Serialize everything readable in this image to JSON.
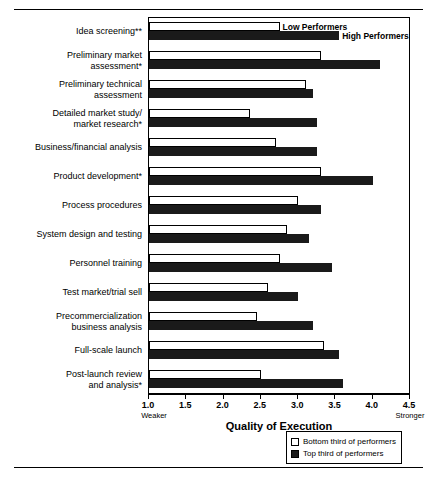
{
  "chart_data": {
    "type": "bar",
    "orientation": "horizontal",
    "title": "",
    "xlabel": "Quality of Execution",
    "ylabel": "",
    "xlim": [
      1.0,
      4.5
    ],
    "xticks": [
      "1.0",
      "1.5",
      "2.0",
      "2.5",
      "3.0",
      "3.5",
      "4.0",
      "4.5"
    ],
    "xtick_values": [
      1.0,
      1.5,
      2.0,
      2.5,
      3.0,
      3.5,
      4.0,
      4.5
    ],
    "axis_low_annotation": "Weaker",
    "axis_high_annotation": "Stronger",
    "grid": false,
    "legend_position": "bottom-right",
    "categories": [
      "Idea screening**",
      "Preliminary market\nassessment*",
      "Preliminary technical\nassessment",
      "Detailed market study/\nmarket research*",
      "Business/financial analysis",
      "Product development*",
      "Process procedures",
      "System design and testing",
      "Personnel training",
      "Test market/trial sell",
      "Precommercialization\nbusiness analysis",
      "Full-scale launch",
      "Post-launch review\nand analysis*"
    ],
    "series": [
      {
        "name": "Bottom third of performers",
        "short_name": "Low Performers",
        "color": "#ffffff",
        "values": [
          2.75,
          3.3,
          3.1,
          2.35,
          2.7,
          3.3,
          3.0,
          2.85,
          2.75,
          2.6,
          2.45,
          3.35,
          2.5
        ]
      },
      {
        "name": "Top third of performers",
        "short_name": "High Performers",
        "color": "#1a1a1a",
        "values": [
          3.55,
          4.1,
          3.2,
          3.25,
          3.25,
          4.0,
          3.3,
          3.15,
          3.45,
          3.0,
          3.2,
          3.55,
          3.6
        ]
      }
    ]
  },
  "callouts": {
    "low_performers": "Low Performers",
    "high_performers": "High Performers"
  },
  "legend": {
    "items": [
      {
        "label": "Bottom third of performers",
        "swatch": "low"
      },
      {
        "label": "Top third of performers",
        "swatch": "high"
      }
    ]
  }
}
